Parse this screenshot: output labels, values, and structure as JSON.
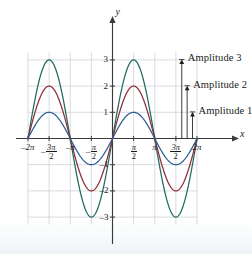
{
  "figure": {
    "background": "#ffffff"
  },
  "axes": {
    "x_axis_name": "x",
    "y_axis_name": "y",
    "x_ticks": [
      {
        "value": -6.2832,
        "label": "-2π",
        "kind": "plain",
        "text": "–2π"
      },
      {
        "value": -4.7124,
        "label": "-3π/2",
        "kind": "fraction",
        "sign": "–",
        "num": "3π",
        "den": "2"
      },
      {
        "value": -3.1416,
        "label": "-π",
        "kind": "plain",
        "text": "–π"
      },
      {
        "value": -1.5708,
        "label": "-π/2",
        "kind": "fraction",
        "sign": "–",
        "num": "π",
        "den": "2"
      },
      {
        "value": 1.5708,
        "label": "π/2",
        "kind": "fraction",
        "sign": "",
        "num": "π",
        "den": "2"
      },
      {
        "value": 3.1416,
        "label": "π",
        "kind": "plain",
        "text": "π"
      },
      {
        "value": 4.7124,
        "label": "3π/2",
        "kind": "fraction",
        "sign": "",
        "num": "3π",
        "den": "2"
      },
      {
        "value": 6.2832,
        "label": "2π",
        "kind": "plain",
        "text": "2π"
      }
    ],
    "y_ticks": [
      {
        "value": 3,
        "text": "3"
      },
      {
        "value": 2,
        "text": "2"
      },
      {
        "value": 1,
        "text": "1"
      },
      {
        "value": -1,
        "text": "–1"
      },
      {
        "value": -2,
        "text": "–2"
      },
      {
        "value": -3,
        "text": "–3"
      }
    ],
    "xlim": [
      -6.2832,
      6.2832
    ],
    "ylim": [
      -3.4,
      3.4
    ],
    "grid": true,
    "grid_color": "#c9ccd4",
    "axis_color": "#3a3a3a"
  },
  "annotations": [
    {
      "id": "amp3",
      "label": "Amplitude 3",
      "value": 3,
      "x_at": 5.15,
      "color": "#1a1a1a"
    },
    {
      "id": "amp2",
      "label": "Amplitude 2",
      "value": 2,
      "x_at": 5.55,
      "color": "#1a1a1a"
    },
    {
      "id": "amp1",
      "label": "Amplitude 1",
      "value": 1,
      "x_at": 5.95,
      "color": "#1a1a1a"
    }
  ],
  "chart_data": {
    "type": "line",
    "title": "",
    "xlabel": "x",
    "ylabel": "y",
    "xlim": [
      -6.2832,
      6.2832
    ],
    "ylim": [
      -3.4,
      3.4
    ],
    "grid": true,
    "legend": "none",
    "x_tick_labels": [
      "–2π",
      "–3π/2",
      "–π",
      "–π/2",
      "π/2",
      "π",
      "3π/2",
      "2π"
    ],
    "x_tick_values": [
      -6.2832,
      -4.7124,
      -3.1416,
      -1.5708,
      1.5708,
      3.1416,
      4.7124,
      6.2832
    ],
    "y_tick_labels": [
      "3",
      "2",
      "1",
      "–1",
      "–2",
      "–3"
    ],
    "y_tick_values": [
      3,
      2,
      1,
      -1,
      -2,
      -3
    ],
    "series": [
      {
        "name": "y = 3 sin x",
        "amplitude": 3,
        "color": "#206a62",
        "maxima": [
          {
            "x": -4.7124,
            "y": 3
          },
          {
            "x": 1.5708,
            "y": 3
          }
        ],
        "minima": [
          {
            "x": -1.5708,
            "y": -3
          },
          {
            "x": 4.7124,
            "y": -3
          }
        ],
        "zeros": [
          -6.2832,
          -3.1416,
          0,
          3.1416,
          6.2832
        ]
      },
      {
        "name": "y = 2 sin x",
        "amplitude": 2,
        "color": "#8c2f39",
        "maxima": [
          {
            "x": -4.7124,
            "y": 2
          },
          {
            "x": 1.5708,
            "y": 2
          }
        ],
        "minima": [
          {
            "x": -1.5708,
            "y": -2
          },
          {
            "x": 4.7124,
            "y": -2
          }
        ],
        "zeros": [
          -6.2832,
          -3.1416,
          0,
          3.1416,
          6.2832
        ]
      },
      {
        "name": "y = sin x",
        "amplitude": 1,
        "color": "#2d5f8f",
        "maxima": [
          {
            "x": -4.7124,
            "y": 1
          },
          {
            "x": 1.5708,
            "y": 1
          }
        ],
        "minima": [
          {
            "x": -1.5708,
            "y": -1
          },
          {
            "x": 4.7124,
            "y": -1
          }
        ],
        "zeros": [
          -6.2832,
          -3.1416,
          0,
          3.1416,
          6.2832
        ]
      }
    ],
    "annotations": [
      {
        "text": "Amplitude 3",
        "points_to": 3
      },
      {
        "text": "Amplitude 2",
        "points_to": 2
      },
      {
        "text": "Amplitude 1",
        "points_to": 1
      }
    ]
  }
}
